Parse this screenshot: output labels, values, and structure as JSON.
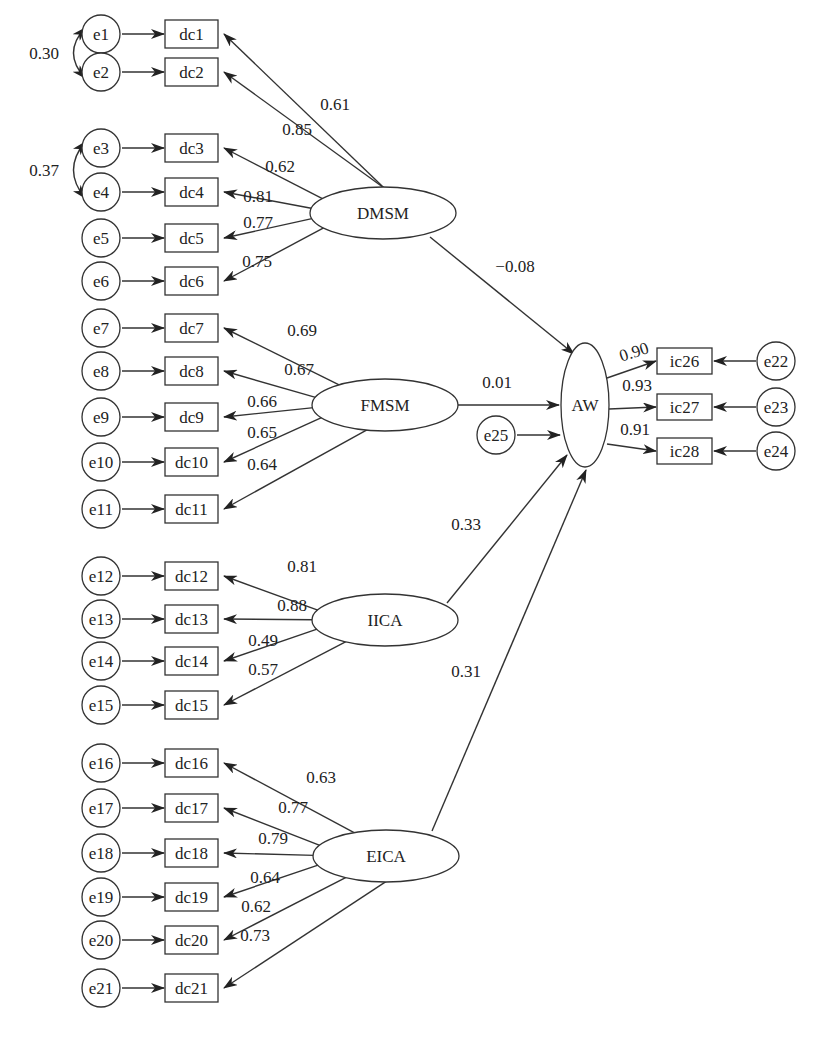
{
  "diagram": {
    "type": "structural-equation-model",
    "latents": [
      {
        "id": "DMSM",
        "label": "DMSM",
        "cx": 383,
        "cy": 213,
        "rx": 73,
        "ry": 26
      },
      {
        "id": "FMSM",
        "label": "FMSM",
        "cx": 385,
        "cy": 405,
        "rx": 73,
        "ry": 26
      },
      {
        "id": "IICA",
        "label": "IICA",
        "cx": 385,
        "cy": 620,
        "rx": 73,
        "ry": 26
      },
      {
        "id": "EICA",
        "label": "EICA",
        "cx": 386,
        "cy": 856,
        "rx": 73,
        "ry": 26
      },
      {
        "id": "AW",
        "label": "AW",
        "cx": 585,
        "cy": 405,
        "rx": 24,
        "ry": 62
      }
    ],
    "indicators": [
      {
        "label": "dc1",
        "error": "e1",
        "y": 34,
        "loading": "0.61",
        "factor": "DMSM"
      },
      {
        "label": "dc2",
        "error": "e2",
        "y": 72,
        "loading": "0.85",
        "factor": "DMSM"
      },
      {
        "label": "dc3",
        "error": "e3",
        "y": 148,
        "loading": "0.62",
        "factor": "DMSM"
      },
      {
        "label": "dc4",
        "error": "e4",
        "y": 192,
        "loading": "0.81",
        "factor": "DMSM"
      },
      {
        "label": "dc5",
        "error": "e5",
        "y": 238,
        "loading": "0.77",
        "factor": "DMSM"
      },
      {
        "label": "dc6",
        "error": "e6",
        "y": 281,
        "loading": "0.75",
        "factor": "DMSM"
      },
      {
        "label": "dc7",
        "error": "e7",
        "y": 328,
        "loading": "0.69",
        "factor": "FMSM"
      },
      {
        "label": "dc8",
        "error": "e8",
        "y": 371,
        "loading": "0.67",
        "factor": "FMSM"
      },
      {
        "label": "dc9",
        "error": "e9",
        "y": 417,
        "loading": "0.66",
        "factor": "FMSM"
      },
      {
        "label": "dc10",
        "error": "e10",
        "y": 462,
        "loading": "0.65",
        "factor": "FMSM"
      },
      {
        "label": "dc11",
        "error": "e11",
        "y": 509,
        "loading": "0.64",
        "factor": "FMSM"
      },
      {
        "label": "dc12",
        "error": "e12",
        "y": 576,
        "loading": "0.81",
        "factor": "IICA"
      },
      {
        "label": "dc13",
        "error": "e13",
        "y": 619,
        "loading": "0.88",
        "factor": "IICA"
      },
      {
        "label": "dc14",
        "error": "e14",
        "y": 661,
        "loading": "0.49",
        "factor": "IICA"
      },
      {
        "label": "dc15",
        "error": "e15",
        "y": 705,
        "loading": "0.57",
        "factor": "IICA"
      },
      {
        "label": "dc16",
        "error": "e16",
        "y": 763,
        "loading": "0.63",
        "factor": "EICA"
      },
      {
        "label": "dc17",
        "error": "e17",
        "y": 808,
        "loading": "0.77",
        "factor": "EICA"
      },
      {
        "label": "dc18",
        "error": "e18",
        "y": 853,
        "loading": "0.79",
        "factor": "EICA"
      },
      {
        "label": "dc19",
        "error": "e19",
        "y": 897,
        "loading": "0.64",
        "factor": "EICA"
      },
      {
        "label": "dc20",
        "error": "e20",
        "y": 940,
        "loading": "0.62",
        "factor": "EICA"
      },
      {
        "label": "dc21",
        "error": "e21",
        "y": 988,
        "loading": "0.73",
        "factor": "EICA"
      }
    ],
    "outcome_indicators": [
      {
        "label": "ic26",
        "error": "e22",
        "y": 361,
        "loading": "0.90"
      },
      {
        "label": "ic27",
        "error": "e23",
        "y": 407,
        "loading": "0.93"
      },
      {
        "label": "ic28",
        "error": "e24",
        "y": 451,
        "loading": "0.91"
      }
    ],
    "structural_paths": [
      {
        "from": "DMSM",
        "to": "AW",
        "coef": "−0.08"
      },
      {
        "from": "FMSM",
        "to": "AW",
        "coef": "0.01"
      },
      {
        "from": "IICA",
        "to": "AW",
        "coef": "0.33"
      },
      {
        "from": "EICA",
        "to": "AW",
        "coef": "0.31"
      }
    ],
    "disturbance": {
      "label": "e25",
      "target": "AW"
    },
    "error_covariances": [
      {
        "between": [
          "e1",
          "e2"
        ],
        "value": "0.30"
      },
      {
        "between": [
          "e3",
          "e4"
        ],
        "value": "0.37"
      }
    ]
  }
}
